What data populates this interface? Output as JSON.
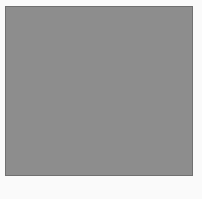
{
  "figure": {
    "caption": "b)",
    "panel_label": "b)",
    "background_color": "#fafafa",
    "mesh_fill_color": "#8d8d8d",
    "mesh_edge_color": "#343434",
    "mesh_vertex_color": "#1c1c1c",
    "body_fill_color": "#1f1f1f",
    "panel": {
      "x": 5,
      "y": 6,
      "width": 188,
      "height": 170
    }
  },
  "chart_data": {
    "type": "scatter",
    "subtitle": "Unstructured triangular mesh with local refinement around an inclined elliptical body",
    "xlabel": "",
    "ylabel": "",
    "xlim": [
      0,
      188
    ],
    "ylim": [
      0,
      170
    ],
    "grid": false,
    "legend_position": "none",
    "annotations": [
      "b)"
    ],
    "mesh": {
      "domain_width": 188,
      "domain_height": 170,
      "body": {
        "shape": "ellipse",
        "center_x": 95,
        "center_y": 84,
        "semi_major": 49,
        "semi_minor": 32,
        "rotation_deg": -37,
        "fill": "#1f1f1f"
      },
      "refinement": {
        "near_body_spacing": 1.6,
        "far_field_spacing": 13.0,
        "growth_exponent": 1.55,
        "boundary_layer_rings": 26,
        "boundary_layer_first_thickness": 1.1,
        "boundary_layer_growth": 1.13,
        "circumferential_divisions": 132,
        "interior_dense_rings": 14
      },
      "wake": {
        "enabled": true,
        "axis_deg": -37,
        "refine_factor": 0.62,
        "extent": 46
      },
      "counts": {
        "approx_nodes": 5200,
        "approx_triangles": 10100
      },
      "style": {
        "edge_width_far": 0.55,
        "edge_width_near": 0.3,
        "vertex_radius_far": 0.95,
        "vertex_radius_near": 0.0
      }
    }
  }
}
